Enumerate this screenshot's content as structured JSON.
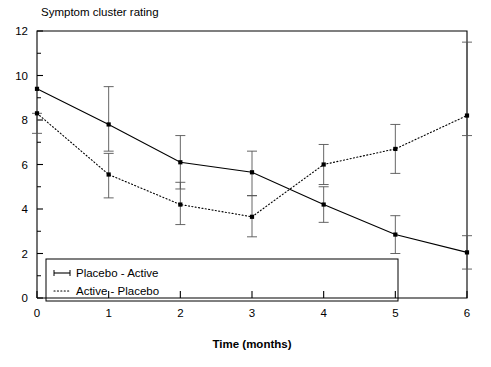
{
  "chart_data": {
    "type": "line",
    "title": "Symptom cluster rating",
    "subtitle": "",
    "xlabel": "Time (months)",
    "ylabel": "",
    "x": [
      0,
      1,
      2,
      3,
      4,
      5,
      6
    ],
    "xtick_labels": [
      "0",
      "1",
      "2",
      "3",
      "4",
      "5",
      "6"
    ],
    "ytick_labels": [
      "0",
      "2",
      "4",
      "6",
      "8",
      "10",
      "12"
    ],
    "yticks": [
      0,
      2,
      4,
      6,
      8,
      10,
      12
    ],
    "xlim": [
      0,
      6
    ],
    "ylim": [
      0,
      12
    ],
    "grid": false,
    "legend_position": "bottom-left",
    "error_bars": true,
    "series": [
      {
        "name": "Placebo - Active",
        "style": "solid",
        "marker": "square",
        "color": "#000000",
        "values": [
          9.4,
          7.8,
          6.1,
          5.65,
          4.2,
          2.85,
          2.05
        ],
        "err_low": [
          9.4,
          6.6,
          4.9,
          4.6,
          3.4,
          2.0,
          1.3
        ],
        "err_high": [
          9.4,
          9.5,
          7.3,
          6.6,
          5.0,
          3.7,
          2.8
        ]
      },
      {
        "name": "Active - Placebo",
        "style": "dotted",
        "marker": "square",
        "color": "#000000",
        "values": [
          8.3,
          5.55,
          4.2,
          3.65,
          6.0,
          6.7,
          8.2
        ],
        "err_low": [
          7.4,
          4.5,
          3.3,
          2.75,
          5.1,
          5.6,
          7.3
        ],
        "err_high": [
          8.3,
          6.5,
          5.2,
          4.6,
          6.9,
          7.8,
          11.5
        ]
      }
    ]
  },
  "legend": {
    "entries": [
      {
        "label": "Placebo - Active",
        "style": "solid"
      },
      {
        "label": "Active - Placebo",
        "style": "dotted"
      }
    ]
  },
  "caption": {
    "text": ""
  }
}
